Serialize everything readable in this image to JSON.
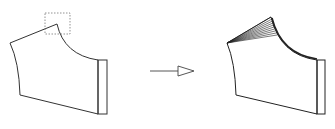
{
  "diagram": {
    "colors": {
      "stroke": "#333333",
      "dashed_box": "#777777",
      "background": "#ffffff"
    },
    "left_piece": {
      "label": "",
      "has_selection_box": true
    },
    "arrow": {
      "direction": "right",
      "style": "open-triangle"
    },
    "right_piece": {
      "label": "",
      "fan_lines": 10
    }
  }
}
